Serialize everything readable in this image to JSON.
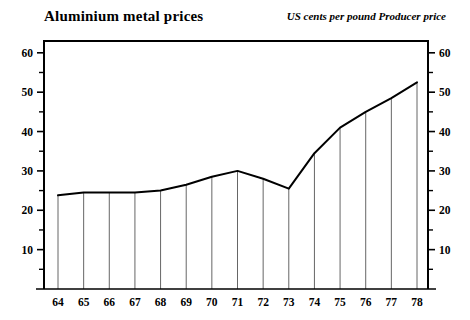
{
  "chart": {
    "title": "Aluminium metal prices",
    "subtitle": "US cents per pound Producer price"
  },
  "chart_data": {
    "type": "line",
    "title": "Aluminium metal prices",
    "subtitle": "US cents per pound Producer price",
    "xlabel": "",
    "ylabel": "US cents per pound",
    "categories": [
      "64",
      "65",
      "66",
      "67",
      "68",
      "69",
      "70",
      "71",
      "72",
      "73",
      "74",
      "75",
      "76",
      "77",
      "78"
    ],
    "values": [
      23.8,
      24.5,
      24.5,
      24.5,
      25.0,
      26.5,
      28.5,
      30.0,
      28.0,
      25.5,
      34.5,
      41.0,
      45.0,
      48.5,
      52.5
    ],
    "xlim": [
      64,
      78
    ],
    "ylim": [
      0,
      63
    ],
    "y_ticks_major": [
      10,
      20,
      30,
      40,
      50,
      60
    ],
    "y_ticks_minor": [
      5,
      15,
      25,
      35,
      45,
      55
    ],
    "y_tick_labels": [
      "10",
      "20",
      "30",
      "40",
      "50",
      "60"
    ],
    "x_tick_labels": [
      "64",
      "65",
      "66",
      "67",
      "68",
      "69",
      "70",
      "71",
      "72",
      "73",
      "74",
      "75",
      "76",
      "77",
      "78"
    ],
    "grid": "vertical-only",
    "legend": "none",
    "axes": "dual-y (left and right mirrored)",
    "line_color": "#000000",
    "grid_color": "#555555",
    "frame_color": "#000000"
  }
}
